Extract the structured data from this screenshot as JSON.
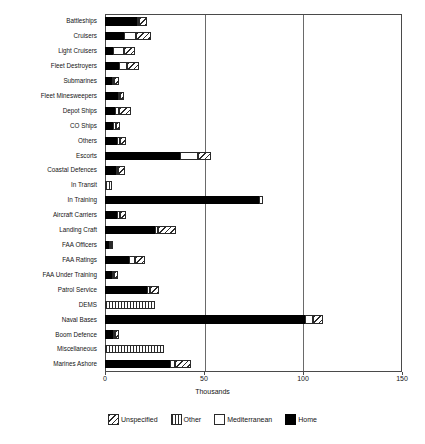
{
  "chart_data": {
    "type": "bar",
    "orientation": "horizontal",
    "stacked": true,
    "title": "",
    "xlabel": "Thousands",
    "ylabel": "",
    "xlim": [
      0,
      150
    ],
    "xticks": [
      0,
      50,
      100,
      150
    ],
    "xtick_labels": [
      "0",
      "50",
      "100",
      "150"
    ],
    "grid": true,
    "legend_position": "bottom",
    "categories": [
      "Battleships",
      "Cruisers",
      "Light Cruisers",
      "Fleet Destroyers",
      "Submarines",
      "Fleet Minesweepers",
      "Depot Ships",
      "CO Ships",
      "Others",
      "Escorts",
      "Coastal Defences",
      "In Transit",
      "In Training",
      "Aircraft Carriers",
      "Landing Craft",
      "FAA Officers",
      "FAA Ratings",
      "FAA Under Training",
      "Patrol Service",
      "DEMS",
      "Naval Bases",
      "Boom Defence",
      "Miscellaneous",
      "Marines Ashore"
    ],
    "series": [
      {
        "name": "Home",
        "color": "#000000",
        "pattern": "solid",
        "values": [
          16.0,
          9.5,
          4.0,
          7.0,
          3.5,
          6.5,
          5.0,
          4.0,
          6.0,
          38.0,
          5.5,
          0.0,
          78.0,
          6.0,
          25.0,
          2.0,
          12.0,
          3.5,
          21.0,
          0.0,
          101.0,
          4.0,
          0.0,
          33.0
        ]
      },
      {
        "name": "Mediterranean",
        "color": "#ffffff",
        "pattern": "blank",
        "values": [
          1.0,
          6.0,
          5.5,
          4.0,
          1.0,
          1.0,
          2.0,
          1.5,
          1.5,
          9.0,
          0.5,
          0.0,
          2.0,
          1.5,
          2.0,
          0.5,
          3.0,
          0.5,
          1.5,
          0.0,
          4.0,
          1.0,
          0.0,
          2.5
        ]
      },
      {
        "name": "Other",
        "color": "#ffffff",
        "pattern": "vertical-lines",
        "values": [
          0.0,
          0.0,
          0.0,
          0.0,
          0.0,
          0.0,
          0.0,
          0.0,
          0.0,
          0.0,
          0.0,
          3.5,
          0.0,
          0.0,
          0.0,
          0.0,
          0.0,
          0.0,
          0.0,
          25.0,
          0.0,
          0.0,
          30.0,
          0.0
        ]
      },
      {
        "name": "Unspecified",
        "color": "#ffffff",
        "pattern": "diagonal-hatch",
        "values": [
          4.0,
          7.5,
          5.5,
          6.0,
          2.5,
          2.0,
          6.0,
          2.0,
          3.0,
          6.5,
          3.5,
          0.0,
          0.0,
          3.0,
          9.0,
          1.0,
          5.0,
          2.0,
          5.0,
          0.0,
          5.0,
          2.0,
          0.0,
          8.0
        ]
      }
    ],
    "legend_entries": [
      {
        "label": "Unspecified",
        "pattern": "diagonal-hatch"
      },
      {
        "label": "Other",
        "pattern": "vertical-lines"
      },
      {
        "label": "Mediterranean",
        "pattern": "blank"
      },
      {
        "label": "Home",
        "pattern": "solid"
      }
    ]
  }
}
